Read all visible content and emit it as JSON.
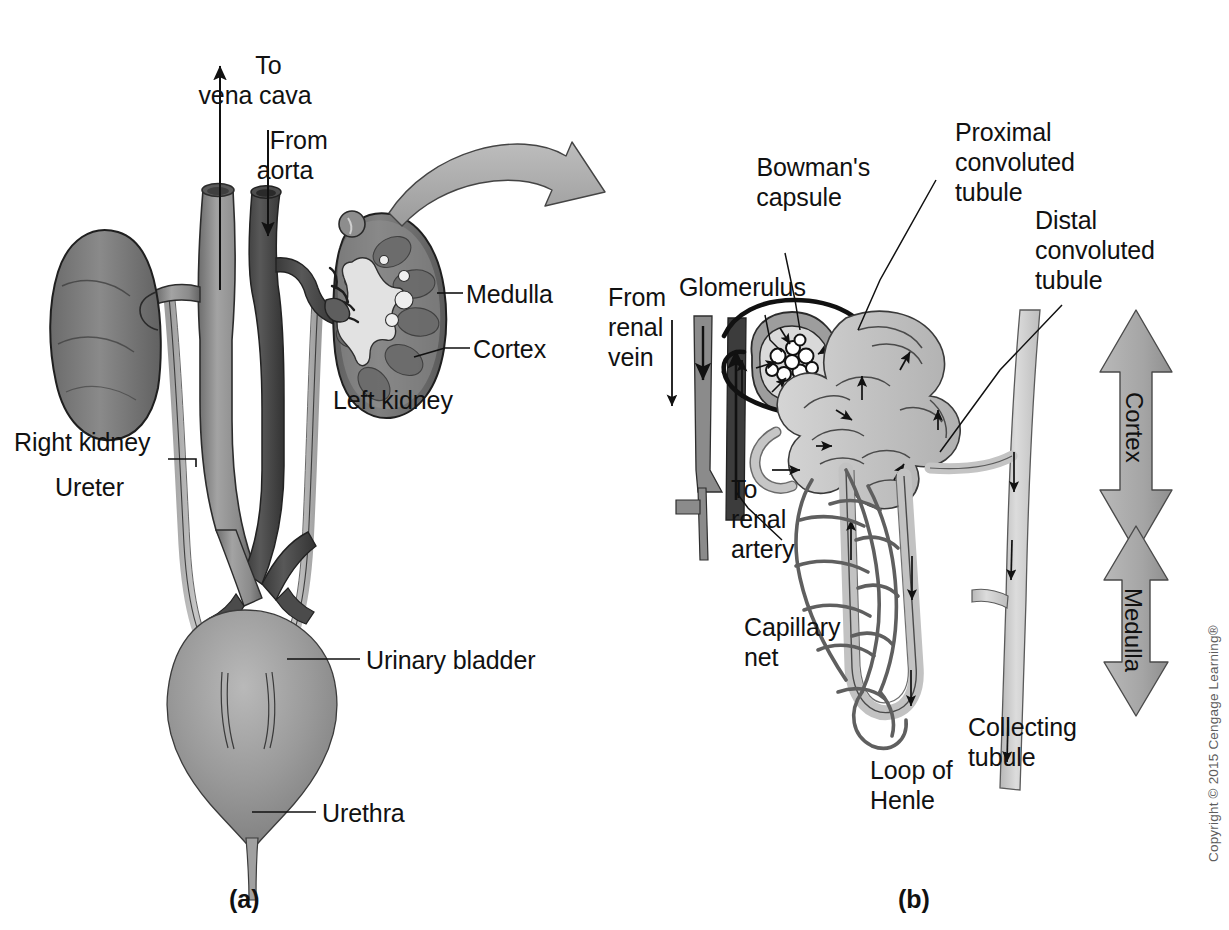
{
  "figure": {
    "panel_a": {
      "id": "(a)",
      "labels": [
        {
          "key": "to_vena_cava",
          "text": "To\nvena cava"
        },
        {
          "key": "from_aorta",
          "text": "From\naorta"
        },
        {
          "key": "medulla",
          "text": "Medulla"
        },
        {
          "key": "cortex",
          "text": "Cortex"
        },
        {
          "key": "left_kidney",
          "text": "Left kidney"
        },
        {
          "key": "right_kidney",
          "text": "Right kidney"
        },
        {
          "key": "ureter",
          "text": "Ureter"
        },
        {
          "key": "urinary_bladder",
          "text": "Urinary bladder"
        },
        {
          "key": "urethra",
          "text": "Urethra"
        }
      ]
    },
    "panel_b": {
      "id": "(b)",
      "labels": [
        {
          "key": "bowmans_capsule",
          "text": "Bowman's\ncapsule"
        },
        {
          "key": "proximal_convoluted_tubule",
          "text": "Proximal\nconvoluted\ntubule"
        },
        {
          "key": "distal_convoluted_tubule",
          "text": "Distal\nconvoluted\ntubule"
        },
        {
          "key": "glomerulus",
          "text": "Glomerulus"
        },
        {
          "key": "from_renal_vein",
          "text": "From\nrenal\nvein"
        },
        {
          "key": "to_renal_artery",
          "text": "To\nrenal\nartery"
        },
        {
          "key": "capillary_net",
          "text": "Capillary\nnet"
        },
        {
          "key": "loop_of_henle",
          "text": "Loop of\nHenle"
        },
        {
          "key": "collecting_tubule",
          "text": "Collecting\ntubule"
        },
        {
          "key": "cortex_zone",
          "text": "Cortex"
        },
        {
          "key": "medulla_zone",
          "text": "Medulla"
        }
      ]
    },
    "copyright": "Copyright © 2015 Cengage Learning®"
  },
  "colors": {
    "background": "#ffffff",
    "outline": "#1a1a1a",
    "kidney_solid": "#7c7c7c",
    "kidney_dark": "#5e5e5e",
    "vein_light": "#949494",
    "artery_dark": "#4a4a4a",
    "bladder": "#9a9a9a",
    "ureter": "#b4b4b4",
    "tubule_fill": "#c9c9c9",
    "tubule_light": "#d8d8d8",
    "capillary": "#6f6f6f",
    "arrow_fill": "#a8a8a8",
    "zone_arrow": "#aaaaaa",
    "cortex_band": "#888888"
  }
}
